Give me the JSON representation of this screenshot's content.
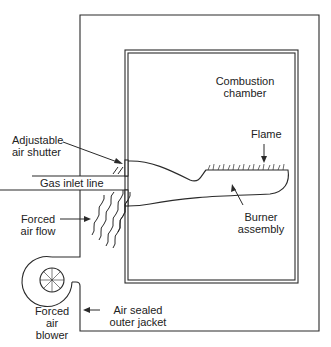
{
  "diagram": {
    "colors": {
      "line": "#2a2a2a",
      "background": "#ffffff",
      "text": "#222222"
    },
    "labels": {
      "combustion_chamber": "Combustion\nchamber",
      "flame": "Flame",
      "adjustable_air_shutter": "Adjustable\nair shutter",
      "gas_inlet_line": "Gas inlet line",
      "forced_air_flow": "Forced\nair flow",
      "burner_assembly": "Burner\nassembly",
      "forced_air_blower": "Forced\nair\nblower",
      "air_sealed_outer_jacket": "Air sealed\nouter jacket"
    },
    "components": [
      "outer-jacket",
      "combustion-chamber",
      "gas-inlet-line",
      "adjustable-air-shutter",
      "burner-assembly",
      "flame",
      "forced-air-flow",
      "forced-air-blower"
    ]
  }
}
